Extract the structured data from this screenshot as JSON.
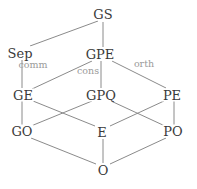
{
  "diagram": {
    "type": "lattice-graph",
    "width": 197,
    "height": 189,
    "colors": {
      "background": "#ffffff",
      "node_text": "#3a3a3a",
      "edge_line": "#7d7d7d",
      "edge_label_text": "#9a9a9a"
    },
    "nodes": [
      {
        "id": "GS",
        "label": "GS",
        "x": 103,
        "y": 14
      },
      {
        "id": "Sep",
        "label": "Sep",
        "x": 20,
        "y": 53
      },
      {
        "id": "GPE",
        "label": "GPE",
        "x": 100,
        "y": 54
      },
      {
        "id": "GE",
        "label": "GE",
        "x": 23,
        "y": 95
      },
      {
        "id": "GPQ",
        "label": "GPQ",
        "x": 101,
        "y": 95
      },
      {
        "id": "PE",
        "label": "PE",
        "x": 172,
        "y": 95
      },
      {
        "id": "GO",
        "label": "GO",
        "x": 22,
        "y": 131
      },
      {
        "id": "E",
        "label": "E",
        "x": 102,
        "y": 132
      },
      {
        "id": "PO",
        "label": "PO",
        "x": 173,
        "y": 131
      },
      {
        "id": "O",
        "label": "O",
        "x": 103,
        "y": 170
      }
    ],
    "edges": [
      {
        "from": "Sep",
        "to": "GS",
        "x1": 30,
        "y1": 46,
        "x2": 98,
        "y2": 21
      },
      {
        "from": "GPE",
        "to": "GS",
        "x1": 103,
        "y1": 47,
        "x2": 103,
        "y2": 22
      },
      {
        "from": "Sep",
        "to": "GE",
        "x1": 22,
        "y1": 60,
        "x2": 22,
        "y2": 88
      },
      {
        "from": "GE",
        "to": "GPE",
        "x1": 32,
        "y1": 89,
        "x2": 92,
        "y2": 61
      },
      {
        "from": "GPE",
        "to": "GPQ",
        "x1": 101,
        "y1": 61,
        "x2": 101,
        "y2": 88
      },
      {
        "from": "GPE",
        "to": "PE",
        "x1": 112,
        "y1": 61,
        "x2": 166,
        "y2": 88
      },
      {
        "from": "GE",
        "to": "E",
        "x1": 33,
        "y1": 101,
        "x2": 95,
        "y2": 126
      },
      {
        "from": "GPQ",
        "to": "GO",
        "x1": 92,
        "y1": 101,
        "x2": 31,
        "y2": 126
      },
      {
        "from": "GPQ",
        "to": "PO",
        "x1": 111,
        "y1": 101,
        "x2": 165,
        "y2": 126
      },
      {
        "from": "PE",
        "to": "E",
        "x1": 164,
        "y1": 101,
        "x2": 110,
        "y2": 126
      },
      {
        "from": "GE",
        "to": "GO",
        "x1": 22,
        "y1": 101,
        "x2": 22,
        "y2": 125
      },
      {
        "from": "PE",
        "to": "PO",
        "x1": 174,
        "y1": 101,
        "x2": 174,
        "y2": 125
      },
      {
        "from": "GO",
        "to": "O",
        "x1": 31,
        "y1": 138,
        "x2": 96,
        "y2": 164
      },
      {
        "from": "E",
        "to": "O",
        "x1": 103,
        "y1": 139,
        "x2": 103,
        "y2": 163
      },
      {
        "from": "PO",
        "to": "O",
        "x1": 166,
        "y1": 138,
        "x2": 110,
        "y2": 164
      }
    ],
    "edge_labels": [
      {
        "id": "comm",
        "label": "comm",
        "x": 33,
        "y": 65
      },
      {
        "id": "cons",
        "label": "cons",
        "x": 88,
        "y": 71
      },
      {
        "id": "orth",
        "label": "orth",
        "x": 144,
        "y": 64
      }
    ]
  }
}
